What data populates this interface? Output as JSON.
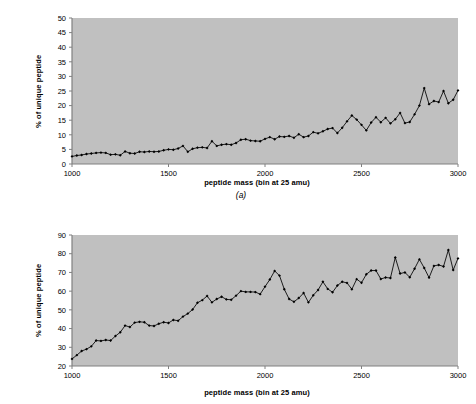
{
  "figure": {
    "background_color": "#ffffff",
    "plot_background_color": "#c0c0c0",
    "axis_color": "#808080",
    "series_color": "#000000"
  },
  "panels": [
    {
      "id": "a",
      "caption": "(a)",
      "chart_data": {
        "type": "line",
        "title": "",
        "xlabel": "peptide mass (bin at 25 amu)",
        "ylabel": "% of unique peptide",
        "xlim": [
          1000,
          3000
        ],
        "ylim": [
          0,
          50
        ],
        "xticks": [
          1000,
          1500,
          2000,
          2500,
          3000
        ],
        "yticks": [
          0,
          5,
          10,
          15,
          20,
          25,
          30,
          35,
          40,
          45,
          50
        ],
        "xtick_labels": [
          "1000",
          "1500",
          "2000",
          "2500",
          "3000"
        ],
        "ytick_labels": [
          "0",
          "5",
          "10",
          "15",
          "20",
          "25",
          "30",
          "35",
          "40",
          "45",
          "50"
        ],
        "grid": false,
        "legend": null,
        "marker": "filled-diamond",
        "bin_width": 25,
        "x": [
          1000,
          1025,
          1050,
          1075,
          1100,
          1125,
          1150,
          1175,
          1200,
          1225,
          1250,
          1275,
          1300,
          1325,
          1350,
          1375,
          1400,
          1425,
          1450,
          1475,
          1500,
          1525,
          1550,
          1575,
          1600,
          1625,
          1650,
          1675,
          1700,
          1725,
          1750,
          1775,
          1800,
          1825,
          1850,
          1875,
          1900,
          1925,
          1950,
          1975,
          2000,
          2025,
          2050,
          2075,
          2100,
          2125,
          2150,
          2175,
          2200,
          2225,
          2250,
          2275,
          2300,
          2325,
          2350,
          2375,
          2400,
          2425,
          2450,
          2475,
          2500,
          2525,
          2550,
          2575,
          2600,
          2625,
          2650,
          2675,
          2700,
          2725,
          2750,
          2775,
          2800,
          2825,
          2850,
          2875,
          2900,
          2925,
          2950,
          2975,
          3000
        ],
        "y": [
          2.6,
          2.9,
          3.1,
          3.4,
          3.6,
          3.8,
          3.9,
          3.8,
          3.2,
          3.3,
          3.0,
          4.3,
          3.7,
          3.6,
          4.2,
          4.1,
          4.3,
          4.2,
          4.3,
          4.7,
          5.0,
          4.9,
          5.3,
          6.2,
          4.2,
          5.2,
          5.6,
          5.7,
          5.5,
          7.8,
          6.2,
          6.6,
          6.8,
          6.6,
          7.2,
          8.3,
          8.5,
          8.0,
          7.9,
          7.8,
          8.6,
          9.2,
          8.5,
          9.4,
          9.3,
          9.6,
          9.0,
          10.2,
          9.2,
          9.6,
          10.9,
          10.5,
          11.2,
          12.0,
          12.3,
          10.6,
          12.4,
          14.6,
          16.6,
          15.2,
          13.4,
          11.5,
          14.2,
          16.0,
          14.3,
          15.8,
          13.9,
          15.3,
          17.5,
          14.0,
          14.4,
          17.0,
          20.0,
          26.0,
          20.5,
          21.6,
          21.2,
          25.0,
          20.8,
          22.0,
          25.2,
          20.0,
          19.9,
          24.0,
          25.3,
          25.7,
          26.4,
          27.5,
          29.0
        ]
      }
    },
    {
      "id": "b",
      "caption": "",
      "chart_data": {
        "type": "line",
        "title": "",
        "xlabel": "peptide mass (bin at 25 amu)",
        "ylabel": "% of unique peptide",
        "xlim": [
          1000,
          3000
        ],
        "ylim": [
          20,
          90
        ],
        "xticks": [
          1000,
          1500,
          2000,
          2500,
          3000
        ],
        "yticks": [
          20,
          30,
          40,
          50,
          60,
          70,
          80,
          90
        ],
        "xtick_labels": [
          "1000",
          "1500",
          "2000",
          "2500",
          "3000"
        ],
        "ytick_labels": [
          "20",
          "30",
          "40",
          "50",
          "60",
          "70",
          "80",
          "90"
        ],
        "grid": false,
        "legend": null,
        "marker": "filled-diamond",
        "bin_width": 25,
        "x": [
          1000,
          1025,
          1050,
          1075,
          1100,
          1125,
          1150,
          1175,
          1200,
          1225,
          1250,
          1275,
          1300,
          1325,
          1350,
          1375,
          1400,
          1425,
          1450,
          1475,
          1500,
          1525,
          1550,
          1575,
          1600,
          1625,
          1650,
          1675,
          1700,
          1725,
          1750,
          1775,
          1800,
          1825,
          1850,
          1875,
          1900,
          1925,
          1950,
          1975,
          2000,
          2025,
          2050,
          2075,
          2100,
          2125,
          2150,
          2175,
          2200,
          2225,
          2250,
          2275,
          2300,
          2325,
          2350,
          2375,
          2400,
          2425,
          2450,
          2475,
          2500,
          2525,
          2550,
          2575,
          2600,
          2625,
          2650,
          2675,
          2700,
          2725,
          2750,
          2775,
          2800,
          2825,
          2850,
          2875,
          2900,
          2925,
          2950,
          2975,
          3000
        ],
        "y": [
          23.8,
          25.8,
          28.0,
          29.0,
          30.5,
          33.6,
          33.4,
          33.9,
          33.6,
          36.0,
          38.0,
          41.6,
          40.8,
          43.2,
          43.6,
          43.4,
          41.6,
          41.4,
          42.6,
          43.4,
          43.0,
          44.6,
          44.2,
          46.4,
          48.0,
          50.2,
          53.8,
          55.2,
          57.4,
          54.0,
          55.8,
          57.0,
          55.6,
          55.4,
          57.6,
          60.0,
          59.6,
          59.6,
          59.5,
          58.4,
          62.4,
          66.2,
          70.8,
          68.3,
          61.0,
          55.8,
          54.3,
          56.3,
          59.0,
          54.0,
          57.8,
          60.6,
          65.0,
          61.2,
          59.4,
          63.0,
          65.0,
          64.4,
          61.0,
          66.4,
          64.5,
          69.0,
          71.0,
          71.0,
          66.5,
          67.3,
          67.0,
          78.0,
          69.4,
          70.0,
          67.4,
          72.0,
          77.0,
          72.4,
          67.2,
          73.5,
          74.0,
          73.2,
          82.0,
          71.3,
          77.5,
          73.0,
          84.6
        ]
      }
    }
  ]
}
